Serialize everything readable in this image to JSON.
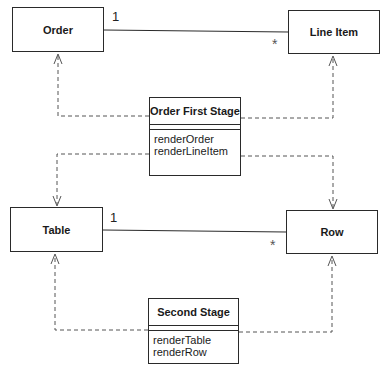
{
  "diagram": {
    "type": "UML class diagram",
    "classes": {
      "order": {
        "name": "Order"
      },
      "line_item": {
        "name": "Line Item"
      },
      "table": {
        "name": "Table"
      },
      "row": {
        "name": "Row"
      },
      "order_first_stage": {
        "name": "Order First Stage",
        "operations": [
          "renderOrder",
          "renderLineItem"
        ]
      },
      "second_stage": {
        "name": "Second Stage",
        "operations": [
          "renderTable",
          "renderRow"
        ]
      }
    },
    "associations": [
      {
        "from": "Order",
        "to": "Line Item",
        "from_mult": "1",
        "to_mult": "*"
      },
      {
        "from": "Table",
        "to": "Row",
        "from_mult": "1",
        "to_mult": "*"
      }
    ],
    "dependencies": [
      {
        "from": "Order First Stage",
        "to": "Order"
      },
      {
        "from": "Order First Stage",
        "to": "Line Item"
      },
      {
        "from": "Order First Stage",
        "to": "Table"
      },
      {
        "from": "Order First Stage",
        "to": "Row"
      },
      {
        "from": "Second Stage",
        "to": "Table"
      },
      {
        "from": "Second Stage",
        "to": "Row"
      }
    ],
    "labels": {
      "order_mult": "1",
      "line_item_mult": "*",
      "table_mult": "1",
      "row_mult": "*"
    }
  }
}
